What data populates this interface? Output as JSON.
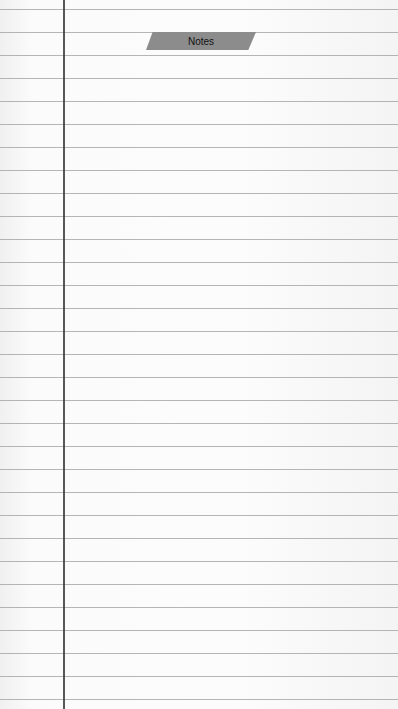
{
  "page": {
    "title": "Notes"
  },
  "paper": {
    "line_count": 31,
    "first_line_y": 9,
    "line_spacing": 23,
    "line_color": "#9e9e9e",
    "margin_x": 63,
    "margin_color": "#3a3a3a"
  },
  "tape": {
    "color": "#8c8c8c"
  }
}
